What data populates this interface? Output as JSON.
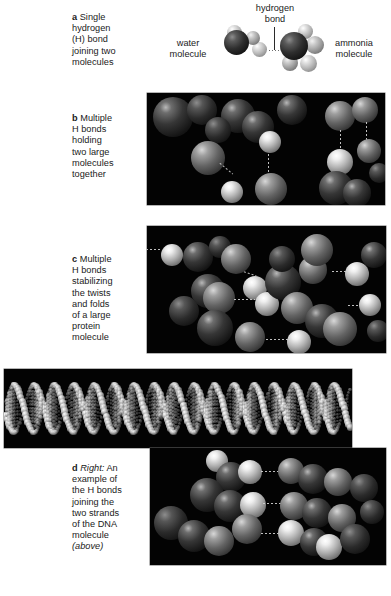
{
  "figure": {
    "background_color": "#ffffff",
    "text_color": "#1a1a1a",
    "photo_background_color": "#000000"
  },
  "panels": [
    {
      "id": "a",
      "letter": "a",
      "caption": "Single hydrogen (H) bond joining two molecules",
      "caption_lines": [
        "Single",
        "hydrogen",
        "(H) bond",
        "joining two",
        "molecules"
      ]
    },
    {
      "id": "b",
      "letter": "b",
      "caption": "Multiple H bonds holding two large molecules together",
      "caption_lines": [
        "Multiple",
        "H bonds",
        "holding",
        "two large",
        "molecules",
        "together"
      ]
    },
    {
      "id": "c",
      "letter": "c",
      "caption": "Multiple H bonds stabilizing the twists and folds of a large protein molecule",
      "caption_lines": [
        "Multiple",
        "H bonds",
        "stabilizing",
        "the twists",
        "and folds",
        "of a large",
        "protein",
        "molecule"
      ]
    },
    {
      "id": "d",
      "letter": "d",
      "caption": "Right: An example of the H bonds joining the two strands of the DNA molecule (above)",
      "caption_lines": [
        "An",
        "example of",
        "the H bonds",
        "joining the",
        "two strands",
        "of the DNA",
        "molecule",
        ""
      ],
      "italic_lead": "Right:",
      "italic_tail": "(above)"
    }
  ],
  "diagram_a": {
    "label_hydrogen_bond": "hydrogen\nbond",
    "label_hydrogen_bond_line1": "hydrogen",
    "label_hydrogen_bond_line2": "bond",
    "label_water_line1": "water",
    "label_water_line2": "molecule",
    "label_ammonia_line1": "ammonia",
    "label_ammonia_line2": "molecule"
  },
  "images": {
    "panel_b_alt": "Photograph of a molecular model: two large molecules held together by multiple hydrogen bonds shown as dotted chains between dark and light spheres on a black background",
    "panel_c_alt": "Photograph of a molecular model: a large protein molecule whose twists and folds are stabilized by multiple hydrogen bonds",
    "dna_strip_alt": "Photograph of a space-filling model of a full DNA double helix, shown horizontally on a black background",
    "panel_d_alt": "Close-up photograph of hydrogen bonds joining the two strands of the DNA molecule"
  }
}
